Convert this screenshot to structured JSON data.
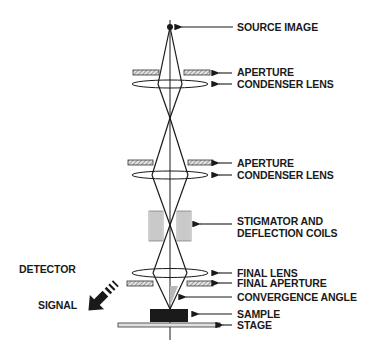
{
  "diagram": {
    "type": "SEM electron column schematic",
    "labels": {
      "source_image": "SOURCE IMAGE",
      "aperture_1": "APERTURE",
      "condenser_lens_1": "CONDENSER LENS",
      "aperture_2": "APERTURE",
      "condenser_lens_2": "CONDENSER LENS",
      "stigmator_line1": "STIGMATOR AND",
      "stigmator_line2": "DEFLECTION COILS",
      "final_lens": "FINAL LENS",
      "final_aperture": "FINAL APERTURE",
      "convergence_angle": "CONVERGENCE ANGLE",
      "sample": "SAMPLE",
      "stage": "STAGE",
      "detector": "DETECTOR",
      "signal": "SIGNAL"
    },
    "colors": {
      "ink": "#1a1a1a",
      "hatch_fill": "#d8d8d8",
      "convergence_shade": "#b8b8b8",
      "sample_fill": "#1a1a1a",
      "stage_fill": "#e0e0e0"
    }
  }
}
